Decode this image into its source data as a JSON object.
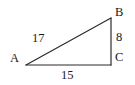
{
  "figure": {
    "type": "right-triangle-diagram",
    "background_color": "#ffffff",
    "stroke_color": "#2b2b2b",
    "text_color": "#1a1a1a",
    "vertices": [
      {
        "name": "A",
        "label": "A",
        "x": 26,
        "y": 65
      },
      {
        "name": "B",
        "label": "B",
        "x": 111,
        "y": 18
      },
      {
        "name": "C",
        "label": "C",
        "x": 111,
        "y": 65
      }
    ],
    "sides": [
      {
        "name": "hypotenuse",
        "from": "A",
        "to": "B",
        "label": "17"
      },
      {
        "name": "vertical-leg",
        "from": "B",
        "to": "C",
        "label": "8"
      },
      {
        "name": "horizontal-leg",
        "from": "A",
        "to": "C",
        "label": "15"
      }
    ],
    "labels": {
      "vertex_a": "A",
      "vertex_b": "B",
      "vertex_c": "C",
      "side_ab": "17",
      "side_bc": "8",
      "side_ac": "15"
    }
  }
}
